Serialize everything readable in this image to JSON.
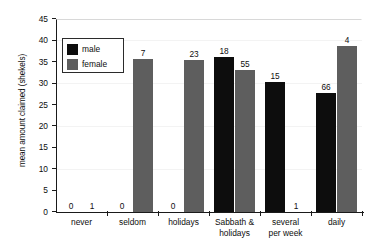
{
  "chart_data": {
    "type": "bar",
    "title": "",
    "subtitle": "",
    "xlabel": "",
    "ylabel": "mean amount claimed (shekels)",
    "ylim": [
      0,
      45
    ],
    "ytick_step": 5,
    "yticks": [
      "45",
      "40",
      "35",
      "30",
      "25",
      "20",
      "15",
      "10",
      "5",
      "0"
    ],
    "grid": true,
    "legend_position": "upper-left-inside",
    "categories": [
      "never",
      "seldom",
      "holidays",
      "Sabbath & holidays",
      "several per week",
      "daily"
    ],
    "category_lines": [
      [
        "never"
      ],
      [
        "seldom"
      ],
      [
        "holidays"
      ],
      [
        "Sabbath &",
        "holidays"
      ],
      [
        "several",
        "per week"
      ],
      [
        "daily"
      ]
    ],
    "series": [
      {
        "name": "male",
        "color": "#0d0d0d",
        "values": [
          0,
          0,
          0,
          36.2,
          30.3,
          27.7
        ],
        "labels": [
          "0",
          "0",
          "0",
          "18",
          "15",
          "66"
        ]
      },
      {
        "name": "female",
        "color": "#5e5e5e",
        "values": [
          0,
          35.6,
          35.4,
          33.1,
          0,
          38.8
        ],
        "labels": [
          "1",
          "7",
          "23",
          "55",
          "1",
          "4"
        ]
      }
    ]
  },
  "legend": {
    "entries": [
      {
        "label": "male",
        "color": "#0d0d0d"
      },
      {
        "label": "female",
        "color": "#5e5e5e"
      }
    ]
  },
  "colors": {
    "male": "#0d0d0d",
    "female": "#5e5e5e",
    "axis": "#1a1a1a",
    "gridline": "#f3f3f3",
    "background": "#ffffff"
  }
}
